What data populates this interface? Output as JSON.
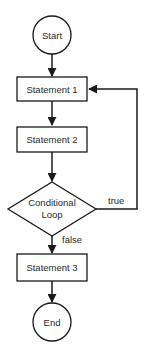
{
  "diagram": {
    "type": "flowchart",
    "nodes": [
      {
        "id": "start",
        "shape": "circle",
        "label": "Start"
      },
      {
        "id": "s1",
        "shape": "rectangle",
        "label": "Statement 1"
      },
      {
        "id": "s2",
        "shape": "rectangle",
        "label": "Statement 2"
      },
      {
        "id": "cond",
        "shape": "diamond",
        "label_line1": "Conditional",
        "label_line2": "Loop"
      },
      {
        "id": "s3",
        "shape": "rectangle",
        "label": "Statement 3"
      },
      {
        "id": "end",
        "shape": "circle",
        "label": "End"
      }
    ],
    "edges": [
      {
        "from": "start",
        "to": "s1",
        "label": ""
      },
      {
        "from": "s1",
        "to": "s2",
        "label": ""
      },
      {
        "from": "s2",
        "to": "cond",
        "label": ""
      },
      {
        "from": "cond",
        "to": "s1",
        "label": "true"
      },
      {
        "from": "cond",
        "to": "s3",
        "label": "false"
      },
      {
        "from": "s3",
        "to": "end",
        "label": ""
      }
    ]
  }
}
